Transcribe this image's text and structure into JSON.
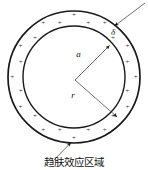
{
  "figure": {
    "caption": "趋肤效应区域",
    "background_color": "#ffffff",
    "stroke_color": "#1a1a1a",
    "leader_color": "#4a4a4a",
    "labels": {
      "delta": "δ",
      "outer_radius_symbol": "a",
      "inner_radius_symbol": "r"
    },
    "charge_symbol": "+",
    "charge_count": 24,
    "geometry": {
      "center_x": 74,
      "center_y": 77,
      "outer_radius": 66,
      "inner_radius": 51,
      "arrow_origin_x": 75,
      "arrow_origin_y": 80
    }
  },
  "chart_data": {
    "type": "diagram",
    "title": "趋肤效应区域",
    "elements": [
      {
        "name": "outer-circle",
        "shape": "circle",
        "cx": 74,
        "cy": 77,
        "r": 66
      },
      {
        "name": "inner-circle",
        "shape": "circle",
        "cx": 74,
        "cy": 77,
        "r": 51
      },
      {
        "name": "annulus-charges",
        "shape": "plus-marks",
        "count": 24,
        "symbol": "+"
      },
      {
        "name": "radius-a-arrow",
        "from": [
          75,
          80
        ],
        "to": [
          110,
          46
        ],
        "label": "a"
      },
      {
        "name": "radius-r-arrow",
        "from": [
          75,
          80
        ],
        "to": [
          118,
          118
        ],
        "label": "r"
      },
      {
        "name": "delta-callout-arrow",
        "from": [
          144,
          4
        ],
        "to": [
          114,
          26
        ],
        "label": "δ"
      },
      {
        "name": "caption-arrow",
        "from": [
          55,
          160
        ],
        "to": [
          72,
          143
        ],
        "label": "趋肤效应区域"
      }
    ]
  }
}
